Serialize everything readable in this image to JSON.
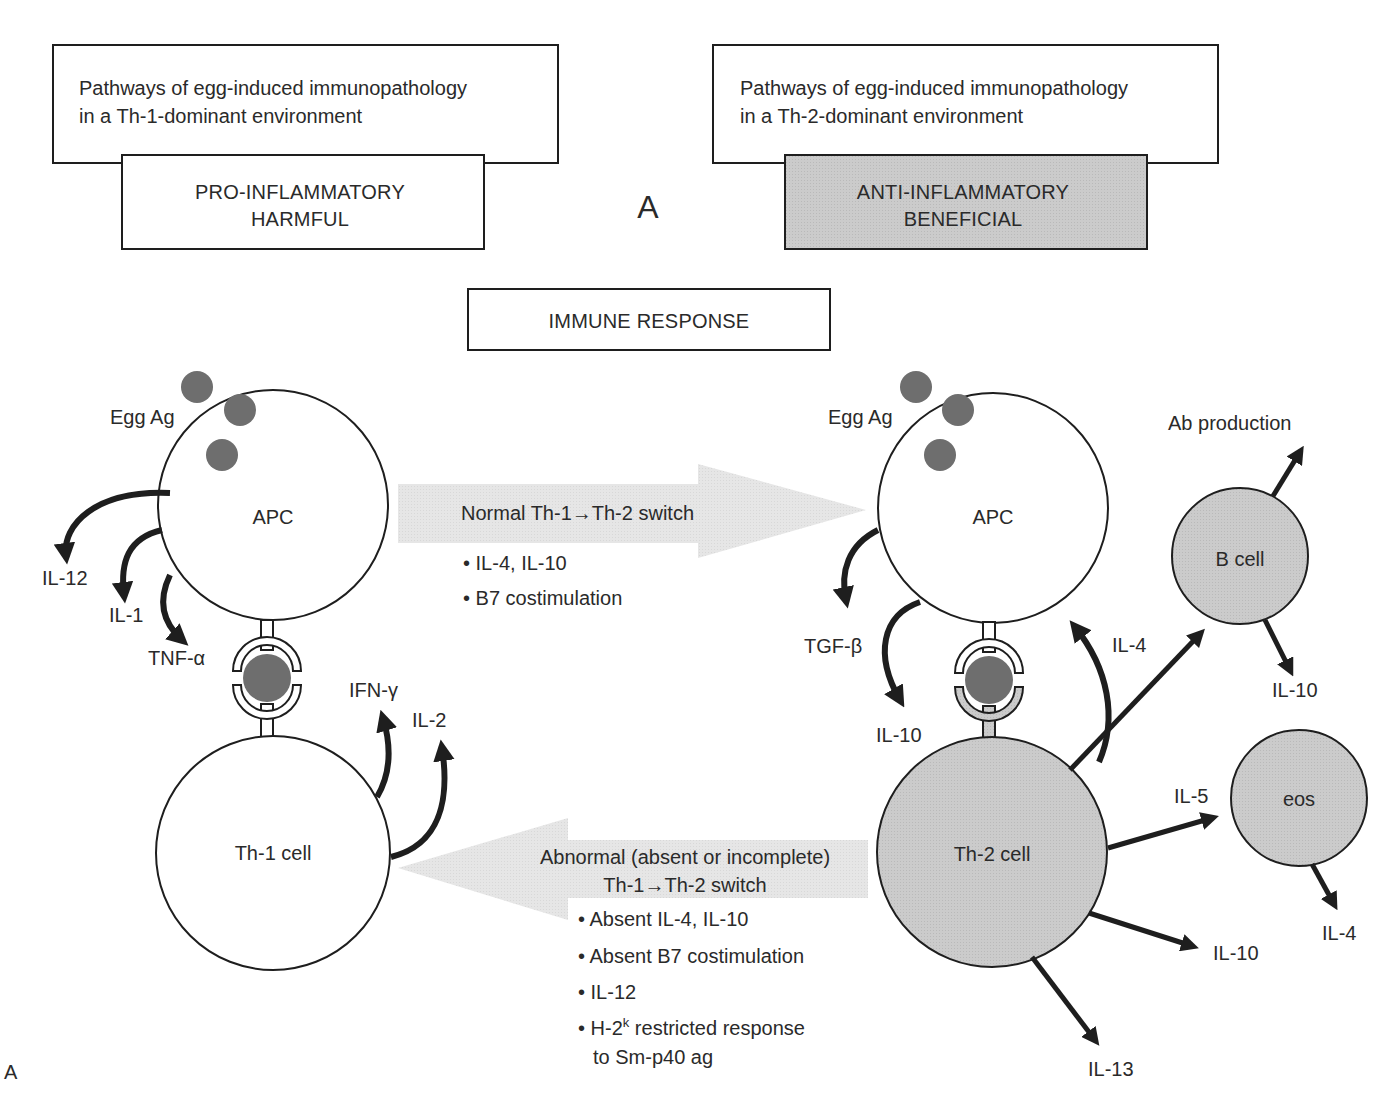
{
  "colors": {
    "stroke": "#1e1e1e",
    "gray_fill": "#c8c8c8",
    "light_gray": "#e4e4e4",
    "antigen": "#6e6e6e",
    "text": "#2a2a2a"
  },
  "left_panel": {
    "title_line1": "Pathways of egg-induced immunopathology",
    "title_line2": "in a Th-1-dominant environment",
    "tag_line1": "PRO-INFLAMMATORY",
    "tag_line2": "HARMFUL"
  },
  "right_panel": {
    "title_line1": "Pathways of egg-induced immunopathology",
    "title_line2": "in a Th-2-dominant environment",
    "tag_line1": "ANTI-INFLAMMATORY",
    "tag_line2": "BENEFICIAL"
  },
  "panel_marker": "A",
  "figure_label": "A",
  "center_box": "IMMUNE RESPONSE",
  "th1_side": {
    "antigen_label": "Egg Ag",
    "apc_label": "APC",
    "cell_label": "Th-1 cell",
    "apc_outputs": [
      "IL-12",
      "IL-1",
      "TNF-α"
    ],
    "cell_outputs": [
      "IFN-γ",
      "IL-2"
    ]
  },
  "th2_side": {
    "antigen_label": "Egg Ag",
    "apc_label": "APC",
    "cell_label": "Th-2 cell",
    "apc_outputs": [
      "TGF-β",
      "IL-10"
    ],
    "cell_feedback": "IL-4",
    "cell_outputs": [
      "IL-5",
      "IL-10",
      "IL-13"
    ],
    "b_cell": {
      "label": "B cell",
      "output_top": "Ab production",
      "output_bottom": "IL-10"
    },
    "eos": {
      "label": "eos",
      "output": "IL-4"
    }
  },
  "normal_switch": {
    "title": "Normal Th-1→Th-2 switch",
    "bullets": [
      "• IL-4, IL-10",
      "• B7 costimulation"
    ]
  },
  "abnormal_switch": {
    "title_line1": "Abnormal (absent or incomplete)",
    "title_line2": "Th-1→Th-2 switch",
    "bullets": [
      "• Absent IL-4, IL-10",
      "• Absent B7 costimulation",
      "• IL-12"
    ],
    "last_bullet_prefix": "• H-2",
    "last_bullet_sup": "k",
    "last_bullet_suffix": " restricted response",
    "last_bullet_line2": "to Sm-p40 ag"
  }
}
